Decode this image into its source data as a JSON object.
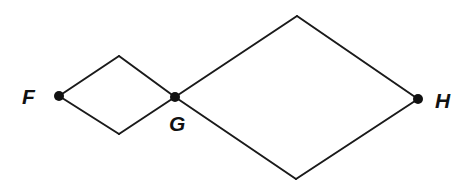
{
  "diagram": {
    "type": "graph",
    "colors": {
      "stroke": "#1a1a1a",
      "node": "#111111",
      "background": "#ffffff"
    },
    "nodes": [
      {
        "id": "F",
        "label": "F",
        "x": 59,
        "y": 96,
        "label_x": 22,
        "label_y": 104,
        "marked": true
      },
      {
        "id": "G",
        "label": "G",
        "x": 175,
        "y": 97,
        "label_x": 169,
        "label_y": 131,
        "marked": true
      },
      {
        "id": "H",
        "label": "H",
        "x": 418,
        "y": 99,
        "label_x": 435,
        "label_y": 108,
        "marked": true
      },
      {
        "id": "small-top",
        "label": "",
        "x": 119,
        "y": 56,
        "marked": false
      },
      {
        "id": "small-bottom",
        "label": "",
        "x": 119,
        "y": 134,
        "marked": false
      },
      {
        "id": "large-top",
        "label": "",
        "x": 297,
        "y": 16,
        "marked": false
      },
      {
        "id": "large-bottom",
        "label": "",
        "x": 296,
        "y": 179,
        "marked": false
      }
    ],
    "edges": [
      {
        "from": "F",
        "to": "small-top"
      },
      {
        "from": "small-top",
        "to": "G"
      },
      {
        "from": "F",
        "to": "small-bottom"
      },
      {
        "from": "small-bottom",
        "to": "G"
      },
      {
        "from": "G",
        "to": "large-top"
      },
      {
        "from": "large-top",
        "to": "H"
      },
      {
        "from": "G",
        "to": "large-bottom"
      },
      {
        "from": "large-bottom",
        "to": "H"
      }
    ],
    "labels": {
      "F": "F",
      "G": "G",
      "H": "H"
    }
  }
}
